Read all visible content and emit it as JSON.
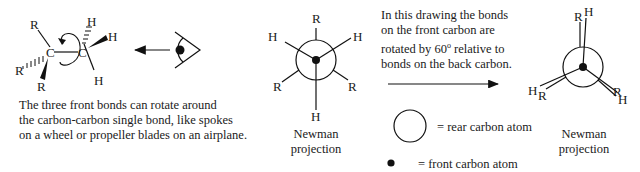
{
  "sawhorse": {
    "atoms": {
      "front_carbon": "C",
      "back_carbon": "C",
      "substituents_left": [
        "R",
        "R",
        "R"
      ],
      "substituents_right": [
        "H",
        "H",
        "H"
      ]
    },
    "caption_lines": [
      "The three front bonds can rotate around",
      "the carbon-carbon single bond, like spokes",
      "on a wheel or propeller blades on an airplane."
    ]
  },
  "viewer": {
    "icon": "eye-icon",
    "direction": "left"
  },
  "newman_staggered": {
    "labels": {
      "top": "R",
      "upper_left": "H",
      "upper_right": "H",
      "lower_left": "R",
      "lower_right": "R",
      "bottom": "H"
    },
    "caption_lines": [
      "Newman",
      "projection"
    ]
  },
  "explanation": {
    "lines": [
      "In this drawing the bonds",
      "on the front carbon are",
      "rotated by 60° relative to",
      "bonds on the back carbon."
    ],
    "pre_sup": "rotated by 60",
    "sup": "o",
    "post_sup": " relative to"
  },
  "legend": {
    "rear": "=  rear carbon atom",
    "front": "= front carbon atom"
  },
  "newman_eclipsed": {
    "labels": {
      "top_back": "R",
      "top_front": "H",
      "left_front": "H",
      "left_back": "R",
      "right_back": "R",
      "right_front": "H"
    },
    "caption_lines": [
      "Newman",
      "projection"
    ]
  }
}
